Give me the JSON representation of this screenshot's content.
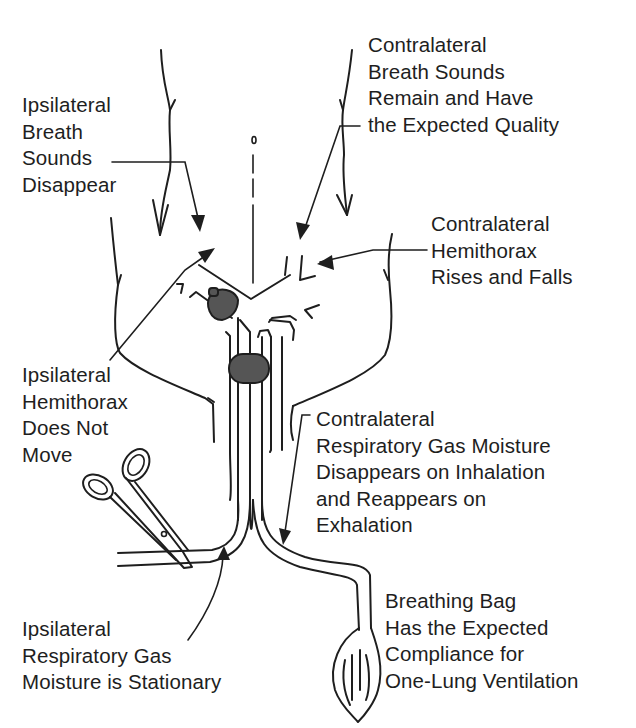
{
  "figure": {
    "type": "anatomical diagram",
    "colors": {
      "ink": "#1e1e1e",
      "cuff_fill": "#555555",
      "background": "#ffffff"
    }
  },
  "labels": {
    "ipsi_breath_sounds": {
      "lines": [
        "Ipsilateral",
        "Breath",
        "Sounds",
        "Disappear"
      ]
    },
    "contra_breath_sounds": {
      "lines": [
        "Contralateral",
        "Breath Sounds",
        "Remain and Have",
        "the Expected Quality"
      ]
    },
    "contra_hemithorax": {
      "lines": [
        "Contralateral",
        "Hemithorax",
        "Rises and Falls"
      ]
    },
    "ipsi_hemithorax": {
      "lines": [
        "Ipsilateral",
        "Hemithorax",
        "Does Not",
        "Move"
      ]
    },
    "contra_gas_moisture": {
      "lines": [
        "Contralateral",
        "Respiratory Gas Moisture",
        "Disappears on Inhalation",
        "and Reappears on",
        "Exhalation"
      ]
    },
    "ipsi_gas_moisture": {
      "lines": [
        "Ipsilateral",
        "Respiratory Gas",
        "Moisture is Stationary"
      ]
    },
    "breathing_bag": {
      "lines": [
        "Breathing Bag",
        "Has the Expected",
        "Compliance for",
        "One-Lung Ventilation"
      ]
    }
  },
  "components": [
    {
      "name": "trachea-midline",
      "icon": "dashed-line"
    },
    {
      "name": "left-lung-outline",
      "icon": "curve"
    },
    {
      "name": "right-lung-outline",
      "icon": "curve"
    },
    {
      "name": "bronchial-cuff",
      "icon": "shaded-cuff"
    },
    {
      "name": "tracheal-cuff",
      "icon": "shaded-cuff"
    },
    {
      "name": "clamp",
      "icon": "hemostat-clamp-icon"
    },
    {
      "name": "breathing-bag",
      "icon": "reservoir-bag-icon"
    }
  ]
}
